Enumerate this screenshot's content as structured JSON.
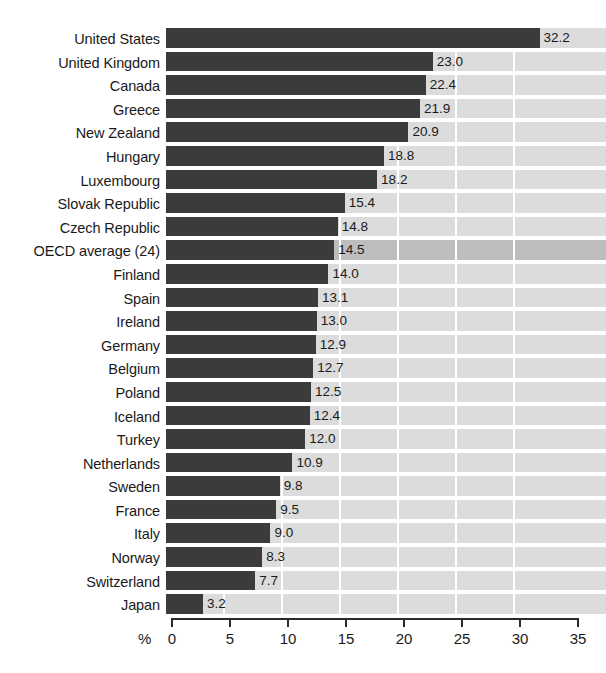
{
  "chart_data": {
    "type": "bar",
    "orientation": "horizontal",
    "title": "",
    "subtitle": "",
    "xlabel": "%",
    "ylabel": "",
    "xlim": [
      0,
      35
    ],
    "xticks": [
      0,
      5,
      10,
      15,
      20,
      25,
      30,
      35
    ],
    "xtick_labels": [
      "0",
      "5",
      "10",
      "15",
      "20",
      "25",
      "30",
      "35"
    ],
    "grid": true,
    "grid_axis": "x",
    "legend": false,
    "categories": [
      "United States",
      "United Kingdom",
      "Canada",
      "Greece",
      "New Zealand",
      "Hungary",
      "Luxembourg",
      "Slovak Republic",
      "Czech Republic",
      "OECD average (24)",
      "Finland",
      "Spain",
      "Ireland",
      "Germany",
      "Belgium",
      "Poland",
      "Iceland",
      "Turkey",
      "Netherlands",
      "Sweden",
      "France",
      "Italy",
      "Norway",
      "Switzerland",
      "Japan"
    ],
    "values": [
      32.2,
      23.0,
      22.4,
      21.9,
      20.9,
      18.8,
      18.2,
      15.4,
      14.8,
      14.5,
      14.0,
      13.1,
      13.0,
      12.9,
      12.7,
      12.5,
      12.4,
      12.0,
      10.9,
      9.8,
      9.5,
      9.0,
      8.3,
      7.7,
      3.2
    ],
    "value_labels": [
      "32.2",
      "23.0",
      "22.4",
      "21.9",
      "20.9",
      "18.8",
      "18.2",
      "15.4",
      "14.8",
      "14.5",
      "14.0",
      "13.1",
      "13.0",
      "12.9",
      "12.7",
      "12.5",
      "12.4",
      "12.0",
      "10.9",
      "9.8",
      "9.5",
      "9.0",
      "8.3",
      "7.7",
      "3.2"
    ],
    "highlight_category": "OECD average (24)",
    "highlight_index": 9,
    "colors": {
      "bar": "#3b3b3b",
      "plot_background": "#dcdcdc",
      "highlight_background": "#bdbdbd",
      "gridline": "#ffffff",
      "axis": "#2a2a2a",
      "text": "#1a1a1a",
      "page_background": "#ffffff"
    }
  }
}
